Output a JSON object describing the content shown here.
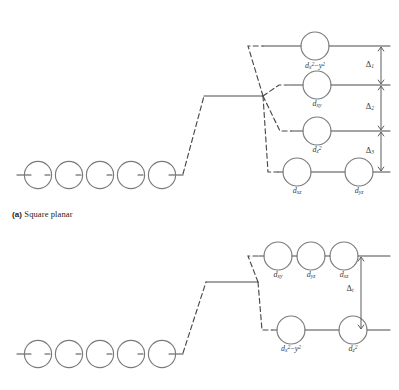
{
  "figure": {
    "title_a": "Square planar",
    "tag_a": "(a)"
  },
  "colors": {
    "line": "#4a4a4a",
    "circle_stroke": "#7a7a7a",
    "text": "#3a3a3a",
    "background": "#ffffff"
  },
  "square_planar": {
    "caption_tag": "(a)",
    "caption_text": "Square planar",
    "free_ion": {
      "label": "",
      "orbital_count": 5
    },
    "levels": [
      {
        "name": "level-1",
        "orbitals": [
          {
            "symbol": "d",
            "sub_pre": "x",
            "sup_pre": "2",
            "operator": "−",
            "sub_post": "y",
            "sup_post": "2",
            "plain": "dx2-y2"
          }
        ]
      },
      {
        "name": "level-2",
        "orbitals": [
          {
            "symbol": "d",
            "sub": "xy",
            "plain": "dxy"
          }
        ]
      },
      {
        "name": "level-3",
        "orbitals": [
          {
            "symbol": "d",
            "sub": "z",
            "sup": "2",
            "plain": "dz2"
          }
        ]
      },
      {
        "name": "level-4",
        "orbitals": [
          {
            "symbol": "d",
            "sub": "xz",
            "plain": "dxz"
          },
          {
            "symbol": "d",
            "sub": "yz",
            "plain": "dyz"
          }
        ]
      }
    ],
    "splittings": [
      {
        "symbol": "Δ",
        "sub": "1",
        "plain": "delta-1"
      },
      {
        "symbol": "Δ",
        "sub": "2",
        "plain": "delta-2"
      },
      {
        "symbol": "Δ",
        "sub": "3",
        "plain": "delta-3"
      }
    ]
  },
  "tetrahedral": {
    "free_ion": {
      "orbital_count": 5
    },
    "levels": [
      {
        "name": "upper-level",
        "orbitals": [
          {
            "symbol": "d",
            "sub": "xy",
            "plain": "dxy"
          },
          {
            "symbol": "d",
            "sub": "yz",
            "plain": "dyz"
          },
          {
            "symbol": "d",
            "sub": "xz",
            "plain": "dxz"
          }
        ]
      },
      {
        "name": "lower-level",
        "orbitals": [
          {
            "symbol": "d",
            "sub_pre": "x",
            "sup_pre": "2",
            "operator": "−",
            "sub_post": "y",
            "sup_post": "2",
            "plain": "dx2-y2"
          },
          {
            "symbol": "d",
            "sub": "z",
            "sup": "2",
            "plain": "dz2"
          }
        ]
      }
    ],
    "splittings": [
      {
        "symbol": "Δ",
        "sub": "t",
        "plain": "delta-t"
      }
    ]
  },
  "labels": {
    "dx2y2": "d",
    "dxy": "d",
    "dz2": "d",
    "dxz": "d",
    "dyz": "d",
    "delta": "Δ",
    "minus": "−"
  },
  "text": {
    "sp_l1_o1_sym": "d",
    "sp_l1_o1_x": "x",
    "sp_l1_o1_x2": "2",
    "sp_l1_o1_op": "−",
    "sp_l1_o1_y": "y",
    "sp_l1_o1_y2": "2",
    "sp_l2_o1_sym": "d",
    "sp_l2_o1_sub": "xy",
    "sp_l3_o1_sym": "d",
    "sp_l3_o1_sub": "z",
    "sp_l3_o1_sup": "2",
    "sp_l4_o1_sym": "d",
    "sp_l4_o1_sub": "xz",
    "sp_l4_o2_sym": "d",
    "sp_l4_o2_sub": "yz",
    "sp_d1_sym": "Δ",
    "sp_d1_sub": "1",
    "sp_d2_sym": "Δ",
    "sp_d2_sub": "2",
    "sp_d3_sym": "Δ",
    "sp_d3_sub": "3",
    "td_u_o1_sym": "d",
    "td_u_o1_sub": "xy",
    "td_u_o2_sym": "d",
    "td_u_o2_sub": "yz",
    "td_u_o3_sym": "d",
    "td_u_o3_sub": "xz",
    "td_l_o1_sym": "d",
    "td_l_o1_x": "x",
    "td_l_o1_x2": "2",
    "td_l_o1_op": "−",
    "td_l_o1_y": "y",
    "td_l_o1_y2": "2",
    "td_l_o2_sym": "d",
    "td_l_o2_sub": "z",
    "td_l_o2_sup": "2",
    "td_d1_sym": "Δ",
    "td_d1_sub": "t",
    "caption_tag": "(a)",
    "caption_text": "Square planar"
  }
}
